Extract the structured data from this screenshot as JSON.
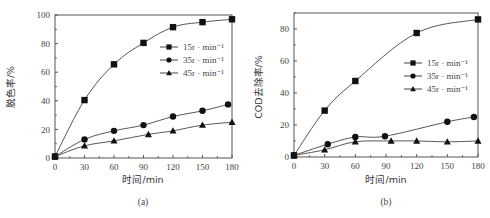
{
  "chart_data": [
    {
      "type": "line",
      "panel_label": "(a)",
      "title": "",
      "xlabel": "时间/min",
      "ylabel": "脱色率/%",
      "xlim": [
        0,
        180
      ],
      "ylim": [
        0,
        100
      ],
      "x_ticks": [
        0,
        30,
        60,
        90,
        120,
        150,
        180
      ],
      "y_ticks": [
        0,
        20,
        40,
        60,
        80,
        100
      ],
      "grid": false,
      "legend_position": "upper right",
      "series": [
        {
          "name": "15r · min⁻¹",
          "marker": "square",
          "x": [
            0,
            30,
            60,
            90,
            120,
            150,
            180
          ],
          "y": [
            1,
            40.5,
            65.5,
            80.5,
            91.5,
            95,
            97
          ]
        },
        {
          "name": "35r · min⁻¹",
          "marker": "circle",
          "x": [
            0,
            30,
            60,
            90,
            120,
            150,
            176
          ],
          "y": [
            1,
            13,
            19,
            23,
            29,
            33,
            37.5
          ]
        },
        {
          "name": "45r · min⁻¹",
          "marker": "triangle",
          "x": [
            0,
            30,
            60,
            95,
            120,
            150,
            180
          ],
          "y": [
            1,
            8.5,
            12,
            16.5,
            19,
            23,
            25
          ]
        }
      ]
    },
    {
      "type": "line",
      "panel_label": "(b)",
      "title": "",
      "xlabel": "时间/min",
      "ylabel": "COD去除率/%",
      "xlim": [
        0,
        180
      ],
      "ylim": [
        0,
        90
      ],
      "x_ticks": [
        0,
        30,
        60,
        90,
        120,
        150,
        180
      ],
      "y_ticks": [
        0,
        20,
        40,
        60,
        80
      ],
      "grid": false,
      "legend_position": "center right",
      "series": [
        {
          "name": "15r · min⁻¹",
          "marker": "square",
          "x": [
            0,
            30,
            60,
            120,
            180
          ],
          "y": [
            1,
            29,
            47.5,
            77.5,
            86
          ]
        },
        {
          "name": "35r · min⁻¹",
          "marker": "circle",
          "x": [
            0,
            33,
            60,
            89,
            150,
            176
          ],
          "y": [
            1,
            8,
            12.5,
            13,
            22,
            25
          ]
        },
        {
          "name": "45r · min⁻¹",
          "marker": "triangle",
          "x": [
            0,
            30,
            60,
            95,
            120,
            150,
            180
          ],
          "y": [
            1,
            4.5,
            9.5,
            10,
            10,
            9.5,
            10
          ]
        }
      ]
    }
  ]
}
